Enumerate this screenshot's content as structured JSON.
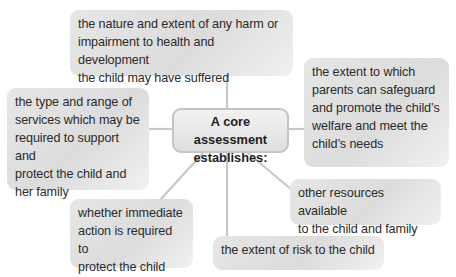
{
  "diagram": {
    "type": "mind-map",
    "center": {
      "line1": "A core assessment",
      "line2": "establishes:"
    },
    "nodes": [
      {
        "id": "top",
        "lines": [
          "the nature and extent of any harm or",
          "impairment to health and development",
          "the child may have suffered"
        ]
      },
      {
        "id": "left",
        "lines": [
          "the type and range of",
          "services which may be",
          "required to support and",
          "protect the child and",
          "her family"
        ]
      },
      {
        "id": "right",
        "lines": [
          "the extent to which",
          "parents can safeguard",
          "and promote the child’s",
          "welfare and meet the",
          "child’s needs"
        ]
      },
      {
        "id": "resources",
        "lines": [
          "other resources available",
          "to the child and family"
        ]
      },
      {
        "id": "immediate",
        "lines": [
          "whether immediate",
          "action is required to",
          "protect the child"
        ]
      },
      {
        "id": "risk",
        "lines": [
          "the extent of risk to the child"
        ]
      }
    ],
    "colors": {
      "node_fill": "#e0e0e0",
      "connector": "#c8c8c8",
      "center_border": "#c4c4c4",
      "text": "#2b2b2b"
    }
  }
}
